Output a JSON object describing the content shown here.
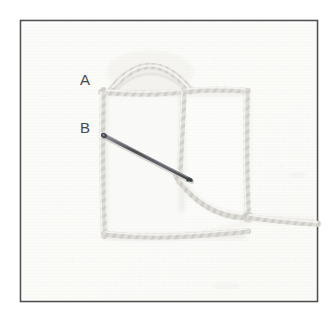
{
  "figure": {
    "background_color": "#fbfbfa",
    "fabric_color": "#f7f7f5",
    "frame": {
      "border_color": "#4f4f4f",
      "border_width_px": 2,
      "x": 20,
      "y": 20,
      "width": 298,
      "height": 282,
      "inner_color": "#fcfcfb"
    },
    "labels": [
      {
        "id": "label-a",
        "text": "A",
        "x": 85,
        "y": 85,
        "color": "#4a4a4a"
      },
      {
        "id": "label-b",
        "text": "B",
        "x": 85,
        "y": 133,
        "color": "#4a4a4a"
      }
    ],
    "threads": {
      "color_light": "#e3e2de",
      "color_mid": "#d2d1cc",
      "color_shadow": "#c4c3bd",
      "description": "pale cream twisted embroidery floss"
    },
    "needle": {
      "color": "#55565a",
      "highlight_color": "#9a9b9f",
      "eye_x": 103,
      "eye_y": 135,
      "tip_x": 191,
      "tip_y": 180,
      "description": "steel tapestry needle angled down to the right"
    },
    "elements": [
      {
        "name": "arc-loop",
        "description": "raised dome-shaped loop of thread above the top bar"
      },
      {
        "name": "top-horizontal-thread",
        "description": "laid bar running left to right near the top"
      },
      {
        "name": "left-vertical-thread",
        "description": "laid bar running down the left side"
      },
      {
        "name": "middle-vertical-thread",
        "description": "laid bar running down the centre"
      },
      {
        "name": "right-vertical-thread",
        "description": "laid bar running down the right side"
      },
      {
        "name": "bottom-horizontal-thread",
        "description": "laid bar running left to right near the bottom"
      },
      {
        "name": "curved-working-thread",
        "description": "working thread sweeping down to the right junction"
      },
      {
        "name": "thread-tail",
        "description": "loose thread tail exiting toward the right edge"
      }
    ]
  }
}
